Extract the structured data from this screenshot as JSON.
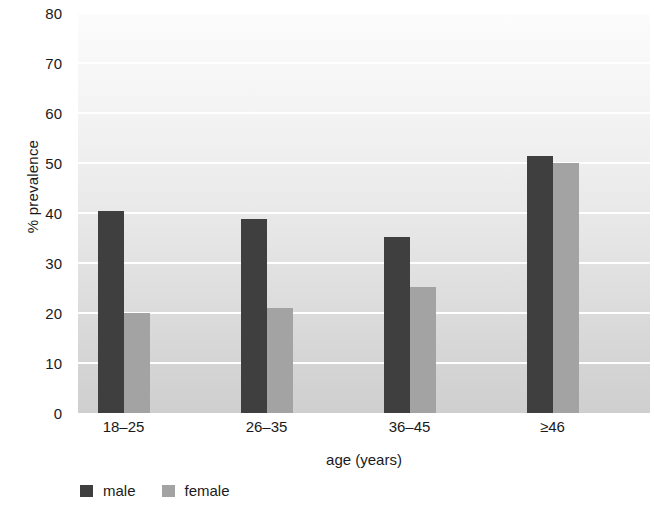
{
  "chart_data": {
    "type": "bar",
    "title": "",
    "xlabel": "age (years)",
    "ylabel": "% prevalence",
    "categories": [
      "18–25",
      "26–35",
      "36–45",
      "≥46"
    ],
    "series": [
      {
        "name": "male",
        "color": "#3f3f3f",
        "values": [
          40.5,
          38.8,
          35.3,
          51.5
        ]
      },
      {
        "name": "female",
        "color": "#a3a3a3",
        "values": [
          20.0,
          21.0,
          25.2,
          50.0
        ]
      }
    ],
    "ylim": [
      0,
      80
    ],
    "yticks": [
      0,
      10,
      20,
      30,
      40,
      50,
      60,
      70,
      80
    ],
    "ytick_labels": [
      "0",
      "10",
      "20",
      "30",
      "40",
      "50",
      "60",
      "70",
      "80"
    ],
    "grid": "horizontal-white-gridlines",
    "legend_position": "below-bottom-left",
    "background": "vertical-gray-gradient"
  },
  "legend": {
    "items": [
      {
        "label": "male",
        "color": "#3f3f3f"
      },
      {
        "label": "female",
        "color": "#a3a3a3"
      }
    ]
  }
}
